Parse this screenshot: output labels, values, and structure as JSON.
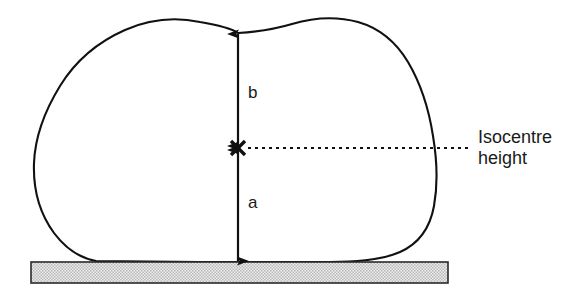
{
  "figure": {
    "type": "schematic-cross-section",
    "background_color": "#ffffff",
    "line_color": "#111111"
  },
  "labels": {
    "upper_dimension": "b",
    "lower_dimension": "a",
    "callout_line1": "Isocentre",
    "callout_line2": "height"
  },
  "elements": {
    "patient_outline_name": "patient-cross-section-outline",
    "couch_name": "treatment-couch-plate",
    "isocentre_marker": "×"
  },
  "geometry": {
    "isocentre_x": 238,
    "isocentre_y": 148,
    "body_top_y": 33,
    "couch_top_y": 262,
    "couch_left_x": 31,
    "couch_right_x": 448,
    "couch_bottom_y": 283,
    "leader_end_x": 470
  },
  "colors": {
    "outline": "#111111",
    "couch_fill": "#d9d9d9",
    "couch_border": "#2a2a2a",
    "text": "#1a1a1a"
  }
}
